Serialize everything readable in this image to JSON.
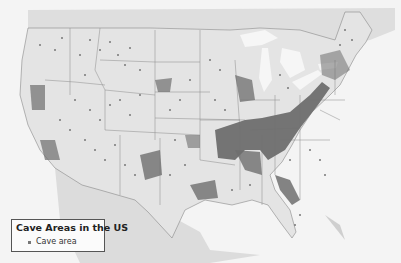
{
  "map": {
    "title": "Cave Areas in the US",
    "colors": {
      "background": "#f4f4f4",
      "land_neighbors": "#dedede",
      "land_us": "#e3e3e3",
      "water": "#f2f2f2",
      "borders": "#777777",
      "cave_area": "#6e6e6e"
    }
  },
  "legend": {
    "title": "Cave Areas in the US",
    "items": [
      {
        "label": "Cave area",
        "symbol": "small-square",
        "color": "#777777"
      }
    ]
  },
  "caption": ""
}
